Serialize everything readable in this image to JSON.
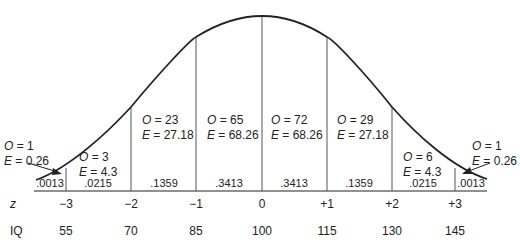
{
  "diagram": {
    "z_label": "z",
    "iq_label": "IQ",
    "z_ticks": [
      "−3",
      "−2",
      "−1",
      "0",
      "+1",
      "+2",
      "+3"
    ],
    "iq_ticks": [
      "55",
      "70",
      "85",
      "100",
      "115",
      "130",
      "145"
    ],
    "regions": [
      {
        "prob": ".0013",
        "O": "O = 1",
        "E": "E = 0.26"
      },
      {
        "prob": ".0215",
        "O": "O = 3",
        "E": "E = 4.3"
      },
      {
        "prob": ".1359",
        "O": "O = 23",
        "E": "E = 27.18"
      },
      {
        "prob": ".3413",
        "O": "O = 65",
        "E": "E = 68.26"
      },
      {
        "prob": ".3413",
        "O": "O = 72",
        "E": "E = 68.26"
      },
      {
        "prob": ".1359",
        "O": "O = 29",
        "E": "E = 27.18"
      },
      {
        "prob": ".0215",
        "O": "O = 6",
        "E": "E = 4.3"
      },
      {
        "prob": ".0013",
        "O": "O = 1",
        "E": "E = 0.26"
      }
    ],
    "colors": {
      "line": "#222222",
      "divider": "#555555"
    }
  }
}
